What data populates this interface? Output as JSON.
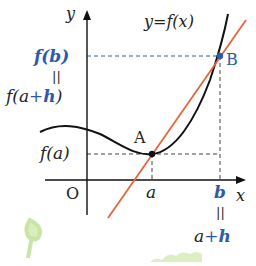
{
  "diagram": {
    "type": "function-graph-secant",
    "axes": {
      "x_label": "x",
      "y_label": "y",
      "origin_label": "O"
    },
    "curve": {
      "label": "y=f(x)",
      "color": "#111111"
    },
    "secant_line": {
      "color": "#e8643a"
    },
    "points": [
      {
        "name": "A",
        "label": "A",
        "color": "#111111"
      },
      {
        "name": "B",
        "label": "B",
        "color": "#2e5aa8"
      }
    ],
    "y_labels": {
      "fb": "f(b)",
      "equals_top": "||",
      "fah_prefix": "f(a",
      "fah_plus": "+",
      "fah_h": "h",
      "fah_suffix": ")",
      "fa": "f(a)"
    },
    "x_labels": {
      "a": "a",
      "b": "b",
      "equals_bottom": "||",
      "ah_a": "a",
      "ah_plus": "+",
      "ah_h": "h"
    },
    "colors": {
      "accent_blue": "#2e5aa8",
      "secant_orange": "#e8643a",
      "dash": "#444444",
      "decoration_green": "#b8dc8a"
    }
  }
}
